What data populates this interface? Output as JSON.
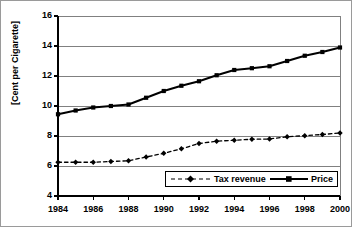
{
  "chart_data": {
    "type": "line",
    "title": "",
    "xlabel": "",
    "ylabel": "[Cent per Cigarette]",
    "xlim": [
      1984,
      2000
    ],
    "ylim": [
      4,
      16
    ],
    "yticks": [
      4,
      6,
      8,
      10,
      12,
      14,
      16
    ],
    "xticks": [
      1984,
      1986,
      1988,
      1990,
      1992,
      1994,
      1996,
      1998,
      2000
    ],
    "xtick_labels": [
      "1984",
      "1986",
      "1988",
      "1990",
      "1992",
      "1994",
      "1996",
      "1998",
      "2000"
    ],
    "ytick_labels": [
      "4",
      "6",
      "8",
      "10",
      "12",
      "14",
      "16"
    ],
    "grid": "horizontal",
    "legend_position": "inside-bottom-right",
    "x": [
      1984,
      1985,
      1986,
      1987,
      1988,
      1989,
      1990,
      1991,
      1992,
      1993,
      1994,
      1995,
      1996,
      1997,
      1998,
      1999,
      2000
    ],
    "series": [
      {
        "name": "Tax revenue",
        "marker": "diamond",
        "line_style": "dashed",
        "color": "#000000",
        "values": [
          6.25,
          6.25,
          6.25,
          6.3,
          6.35,
          6.6,
          6.85,
          7.15,
          7.5,
          7.65,
          7.72,
          7.78,
          7.8,
          7.95,
          8.02,
          8.1,
          8.2
        ]
      },
      {
        "name": "Price",
        "marker": "square",
        "line_style": "solid",
        "color": "#000000",
        "values": [
          9.45,
          9.7,
          9.9,
          10.0,
          10.1,
          10.55,
          11.0,
          11.35,
          11.65,
          12.05,
          12.4,
          12.52,
          12.65,
          13.0,
          13.35,
          13.6,
          13.9
        ]
      }
    ]
  },
  "legend": {
    "items": [
      {
        "label": "Tax revenue",
        "style": "dashed-diamond"
      },
      {
        "label": "Price",
        "style": "solid-square"
      }
    ]
  },
  "axes": {
    "y_title": "[Cent per Cigarette]"
  },
  "colors": {
    "axis": "#000000",
    "gridline": "#808080",
    "border": "#9a9a9a",
    "series": "#000000",
    "background": "#ffffff"
  }
}
